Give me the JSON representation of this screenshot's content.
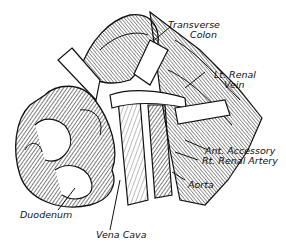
{
  "figure": {
    "type": "anatomical-illustration",
    "style": "black-and-white engraving line drawing",
    "colors": {
      "ink": "#111111",
      "background": "#ffffff",
      "retractor": "#ffffff"
    }
  },
  "labels": {
    "transverse_colon": {
      "line1": "Transverse",
      "line2": "Colon"
    },
    "lt_renal_vein": {
      "line1": "Lt. Renal",
      "line2": "Vein"
    },
    "ant_accessory_rt_renal_artery": {
      "line1": "Ant. Accessory",
      "line2": "Rt. Renal Artery"
    },
    "aorta": {
      "line1": "Aorta"
    },
    "duodenum": {
      "line1": "Duodenum"
    },
    "vena_cava": {
      "line1": "Vena Cava"
    }
  }
}
